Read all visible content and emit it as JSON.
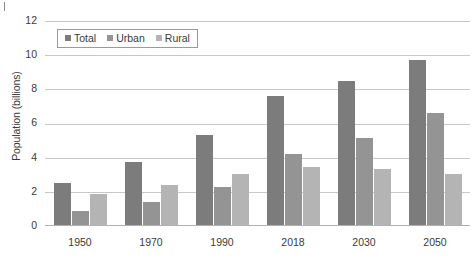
{
  "chart_data": {
    "type": "bar",
    "title": "",
    "xlabel": "",
    "ylabel": "Population (billions)",
    "categories": [
      "1950",
      "1970",
      "1990",
      "2018",
      "2030",
      "2050"
    ],
    "series": [
      {
        "name": "Total",
        "color": "#7c7c7c",
        "values": [
          2.5,
          3.7,
          5.3,
          7.6,
          8.5,
          9.7
        ]
      },
      {
        "name": "Urban",
        "color": "#949494",
        "values": [
          0.8,
          1.35,
          2.25,
          4.2,
          5.1,
          6.6
        ]
      },
      {
        "name": "Rural",
        "color": "#b4b4b4",
        "values": [
          1.8,
          2.35,
          3.0,
          3.4,
          3.3,
          3.0
        ]
      }
    ],
    "ylim": [
      0,
      12
    ],
    "yticks": [
      "0",
      "2",
      "4",
      "6",
      "8",
      "10",
      "12"
    ],
    "grid": true,
    "legend_position": "top-left",
    "legend_entries": [
      "Total",
      "Urban",
      "Rural"
    ]
  },
  "icons": {
    "legend_marker": "square-swatch-icon",
    "corner_mark": "crop-corner-mark-icon"
  }
}
